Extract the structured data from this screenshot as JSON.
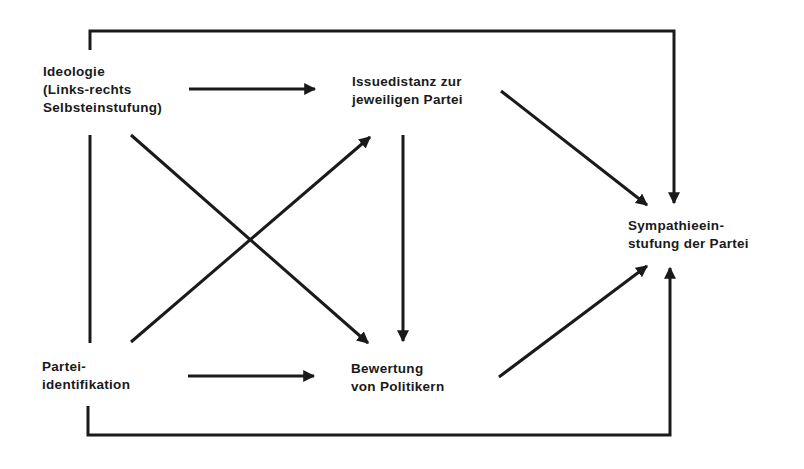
{
  "diagram": {
    "type": "path-model",
    "nodes": {
      "ideologie": {
        "lines": [
          "Ideologie",
          "(Links-rechts",
          "Selbsteinstufung)"
        ]
      },
      "issuedistanz": {
        "lines": [
          "Issuedistanz zur",
          "jeweiligen Partei"
        ]
      },
      "parteiidentifikation": {
        "lines": [
          "Partei-",
          "identifikation"
        ]
      },
      "bewertung": {
        "lines": [
          "Bewertung",
          "von Politikern"
        ]
      },
      "sympathie": {
        "lines": [
          "Sympathieein-",
          "stufung der Partei"
        ]
      }
    },
    "edges": [
      {
        "from": "ideologie",
        "to": "issuedistanz"
      },
      {
        "from": "ideologie",
        "to": "bewertung"
      },
      {
        "from": "ideologie",
        "to": "sympathie",
        "route": "top-bracket"
      },
      {
        "from": "ideologie",
        "to": "parteiidentifikation",
        "style": "undirected"
      },
      {
        "from": "parteiidentifikation",
        "to": "issuedistanz"
      },
      {
        "from": "parteiidentifikation",
        "to": "bewertung"
      },
      {
        "from": "parteiidentifikation",
        "to": "sympathie",
        "route": "bottom-bracket"
      },
      {
        "from": "issuedistanz",
        "to": "bewertung"
      },
      {
        "from": "issuedistanz",
        "to": "sympathie"
      },
      {
        "from": "bewertung",
        "to": "sympathie"
      }
    ],
    "colors": {
      "line": "#1a1a1a",
      "background": "#ffffff"
    }
  }
}
